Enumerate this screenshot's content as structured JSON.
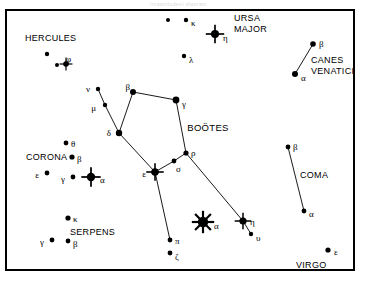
{
  "figure": {
    "kind": "star-chart",
    "cropped_header_text": "(magnitudes)    diagram",
    "frame": {
      "x": 6,
      "y": 10,
      "width": 348,
      "height": 260,
      "border_color": "#000000",
      "background": "#ffffff"
    },
    "ink_color": "#000000"
  },
  "constellation_labels": [
    {
      "id": "hercules",
      "text": "HERCULES",
      "x": 25,
      "y": 41,
      "align": "left",
      "size": 9
    },
    {
      "id": "ursa-major-1",
      "text": "URSA",
      "x": 234,
      "y": 21,
      "align": "left",
      "size": 9
    },
    {
      "id": "ursa-major-2",
      "text": "MAJOR",
      "x": 234,
      "y": 32,
      "align": "left",
      "size": 9
    },
    {
      "id": "canes-venatici-1",
      "text": "CANES",
      "x": 311,
      "y": 63,
      "align": "left",
      "size": 9
    },
    {
      "id": "canes-venatici-2",
      "text": "VENATICI",
      "x": 311,
      "y": 74,
      "align": "left",
      "size": 9
    },
    {
      "id": "bootes",
      "text": "BOÖTES",
      "x": 208,
      "y": 131,
      "align": "middle",
      "size": 9.5
    },
    {
      "id": "corona",
      "text": "CORONA",
      "x": 26,
      "y": 160,
      "align": "left",
      "size": 9
    },
    {
      "id": "serpens",
      "text": "SERPENS",
      "x": 70,
      "y": 235,
      "align": "left",
      "size": 9
    },
    {
      "id": "coma",
      "text": "COMA",
      "x": 300,
      "y": 178,
      "align": "left",
      "size": 9
    },
    {
      "id": "virgo",
      "text": "VIRGO",
      "x": 296,
      "y": 268,
      "align": "left",
      "size": 9
    }
  ],
  "stars": [
    {
      "id": "umajor-unlabeled",
      "label": "",
      "x": 168,
      "y": 20,
      "r": 2.0,
      "spikes": 0,
      "lx": 0,
      "ly": 0
    },
    {
      "id": "umajor-kappa",
      "label": "κ",
      "x": 186,
      "y": 20,
      "r": 2.2,
      "spikes": 0,
      "lx": 5,
      "ly": 3
    },
    {
      "id": "umajor-eta",
      "label": "η",
      "x": 215,
      "y": 34,
      "r": 4.0,
      "spikes": 4,
      "lx": 8,
      "ly": 4
    },
    {
      "id": "umajor-lambda",
      "label": "λ",
      "x": 184,
      "y": 56,
      "r": 2.2,
      "spikes": 0,
      "lx": 5,
      "ly": 4
    },
    {
      "id": "her-unlabeled",
      "label": "",
      "x": 47,
      "y": 54,
      "r": 2.2,
      "spikes": 0,
      "lx": 0,
      "ly": 0
    },
    {
      "id": "her-small",
      "label": "",
      "x": 57,
      "y": 65,
      "r": 2.0,
      "spikes": 0,
      "lx": 0,
      "ly": 0
    },
    {
      "id": "her-phi",
      "label": "φ",
      "x": 66,
      "y": 64,
      "r": 2.8,
      "spikes": 4,
      "lx": 0,
      "ly": -5
    },
    {
      "id": "cvn-beta",
      "label": "β",
      "x": 313,
      "y": 44,
      "r": 2.8,
      "spikes": 0,
      "lx": 6,
      "ly": 0
    },
    {
      "id": "cvn-alpha",
      "label": "α",
      "x": 295,
      "y": 74,
      "r": 3.0,
      "spikes": 0,
      "lx": 6,
      "ly": 4
    },
    {
      "id": "boo-nu",
      "label": "ν",
      "x": 98,
      "y": 89,
      "r": 2.2,
      "spikes": 0,
      "lx": -8,
      "ly": 0
    },
    {
      "id": "boo-mu",
      "label": "μ",
      "x": 105,
      "y": 105,
      "r": 2.2,
      "spikes": 0,
      "lx": -9,
      "ly": 3
    },
    {
      "id": "boo-beta",
      "label": "β",
      "x": 133,
      "y": 92,
      "r": 3.0,
      "spikes": 0,
      "lx": -3,
      "ly": -5
    },
    {
      "id": "boo-gamma",
      "label": "γ",
      "x": 176,
      "y": 100,
      "r": 3.4,
      "spikes": 0,
      "lx": 6,
      "ly": 4
    },
    {
      "id": "boo-delta",
      "label": "δ",
      "x": 119,
      "y": 133,
      "r": 3.2,
      "spikes": 0,
      "lx": -8,
      "ly": 0
    },
    {
      "id": "boo-rho",
      "label": "ρ",
      "x": 186,
      "y": 153,
      "r": 2.6,
      "spikes": 0,
      "lx": 5,
      "ly": 0
    },
    {
      "id": "boo-sigma",
      "label": "σ",
      "x": 174,
      "y": 161,
      "r": 2.4,
      "spikes": 0,
      "lx": 2,
      "ly": 8
    },
    {
      "id": "boo-epsilon",
      "label": "ε",
      "x": 155,
      "y": 172,
      "r": 3.8,
      "spikes": 4,
      "lx": -9,
      "ly": 2
    },
    {
      "id": "boo-pi",
      "label": "π",
      "x": 170,
      "y": 240,
      "r": 2.4,
      "spikes": 0,
      "lx": 5,
      "ly": 1
    },
    {
      "id": "boo-zeta",
      "label": "ζ",
      "x": 170,
      "y": 253,
      "r": 2.4,
      "spikes": 0,
      "lx": 5,
      "ly": 4
    },
    {
      "id": "boo-alpha",
      "label": "α",
      "x": 203,
      "y": 222,
      "r": 5.2,
      "spikes": 8,
      "lx": 11,
      "ly": 4
    },
    {
      "id": "boo-eta",
      "label": "η",
      "x": 243,
      "y": 221,
      "r": 3.6,
      "spikes": 4,
      "lx": 7,
      "ly": 1
    },
    {
      "id": "boo-upsilon",
      "label": "υ",
      "x": 251,
      "y": 234,
      "r": 2.2,
      "spikes": 0,
      "lx": 5,
      "ly": 4
    },
    {
      "id": "crb-theta",
      "label": "θ",
      "x": 66,
      "y": 143,
      "r": 2.4,
      "spikes": 0,
      "lx": 5,
      "ly": 1
    },
    {
      "id": "crb-beta",
      "label": "β",
      "x": 72,
      "y": 157,
      "r": 2.6,
      "spikes": 0,
      "lx": 5,
      "ly": 2
    },
    {
      "id": "crb-epsilon",
      "label": "ε",
      "x": 47,
      "y": 173,
      "r": 2.4,
      "spikes": 0,
      "lx": -8,
      "ly": 2
    },
    {
      "id": "crb-gamma",
      "label": "γ",
      "x": 73,
      "y": 177,
      "r": 2.4,
      "spikes": 0,
      "lx": -8,
      "ly": 2
    },
    {
      "id": "crb-alpha",
      "label": "α",
      "x": 91,
      "y": 177,
      "r": 4.2,
      "spikes": 4,
      "lx": 9,
      "ly": 3
    },
    {
      "id": "ser-kappa",
      "label": "κ",
      "x": 68,
      "y": 218,
      "r": 2.6,
      "spikes": 0,
      "lx": 5,
      "ly": 1
    },
    {
      "id": "ser-gamma",
      "label": "γ",
      "x": 52,
      "y": 240,
      "r": 2.4,
      "spikes": 0,
      "lx": -8,
      "ly": 2
    },
    {
      "id": "ser-beta",
      "label": "β",
      "x": 68,
      "y": 241,
      "r": 2.4,
      "spikes": 0,
      "lx": 5,
      "ly": 3
    },
    {
      "id": "com-beta",
      "label": "β",
      "x": 288,
      "y": 147,
      "r": 2.4,
      "spikes": 0,
      "lx": 5,
      "ly": 0
    },
    {
      "id": "com-alpha",
      "label": "α",
      "x": 304,
      "y": 211,
      "r": 2.4,
      "spikes": 0,
      "lx": 5,
      "ly": 3
    },
    {
      "id": "vir-epsilon",
      "label": "ε",
      "x": 328,
      "y": 250,
      "r": 2.6,
      "spikes": 0,
      "lx": 6,
      "ly": 2
    }
  ],
  "constellation_lines": [
    {
      "id": "cvn-a-b",
      "from": "cvn-alpha",
      "to": "cvn-beta"
    },
    {
      "id": "boo-nu-mu",
      "from": "boo-nu",
      "to": "boo-mu"
    },
    {
      "id": "boo-mu-delta",
      "from": "boo-mu",
      "to": "boo-delta"
    },
    {
      "id": "boo-delta-b",
      "from": "boo-delta",
      "to": "boo-beta"
    },
    {
      "id": "boo-beta-g",
      "from": "boo-beta",
      "to": "boo-gamma"
    },
    {
      "id": "boo-g-rho",
      "from": "boo-gamma",
      "to": "boo-rho"
    },
    {
      "id": "boo-rho-sig",
      "from": "boo-rho",
      "to": "boo-sigma"
    },
    {
      "id": "boo-sig-eps",
      "from": "boo-sigma",
      "to": "boo-epsilon"
    },
    {
      "id": "boo-delta-e",
      "from": "boo-delta",
      "to": "boo-epsilon"
    },
    {
      "id": "boo-eps-pi",
      "from": "boo-epsilon",
      "to": "boo-pi"
    },
    {
      "id": "boo-rho-eta",
      "from": "boo-rho",
      "to": "boo-eta"
    },
    {
      "id": "boo-eta-ups",
      "from": "boo-eta",
      "to": "boo-upsilon"
    },
    {
      "id": "com-b-a",
      "from": "com-beta",
      "to": "com-alpha"
    }
  ]
}
